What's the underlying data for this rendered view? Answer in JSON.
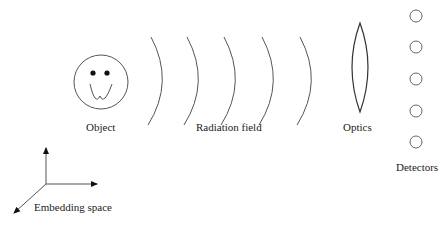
{
  "diagram": {
    "labels": {
      "object": "Object",
      "radiation_field": "Radiation field",
      "optics": "Optics",
      "detectors": "Detectors",
      "embedding_space": "Embedding space"
    },
    "components": [
      {
        "name": "Object",
        "shape": "smiley-face"
      },
      {
        "name": "Radiation field",
        "shape": "wavefront-arcs",
        "count": 5
      },
      {
        "name": "Optics",
        "shape": "biconvex-lens"
      },
      {
        "name": "Detectors",
        "shape": "circles",
        "count": 5
      },
      {
        "name": "Embedding space",
        "shape": "3d-axes"
      }
    ],
    "colors": {
      "stroke": "#555555",
      "text": "#222222",
      "background": "#ffffff"
    }
  }
}
